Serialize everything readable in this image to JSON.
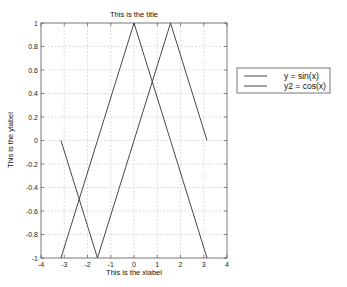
{
  "chart_data": {
    "type": "line",
    "title": "This is the title",
    "xlabel": "This is the xlabel",
    "ylabel": "This is the ylabel",
    "xlim": [
      -4,
      4
    ],
    "ylim": [
      -1,
      1
    ],
    "xticks": [
      -4,
      -3,
      -2,
      -1,
      0,
      1,
      2,
      3,
      4
    ],
    "yticks": [
      -1,
      -0.8,
      -0.6,
      -0.4,
      -0.2,
      0,
      0.2,
      0.4,
      0.6,
      0.8,
      1
    ],
    "xtick_labels": [
      "-4",
      "-3",
      "-2",
      "-1",
      "0",
      "1",
      "2",
      "3",
      "4"
    ],
    "ytick_labels": [
      "-1",
      "-0.8",
      "-0.6",
      "-0.4",
      "-0.2",
      "0",
      "0.2",
      "0.4",
      "0.6",
      "0.8",
      "1"
    ],
    "grid": true,
    "legend_position": "outside right, upper",
    "x": [
      -3.1416,
      -1.5708,
      0,
      1.5708,
      3.1416
    ],
    "series": [
      {
        "name": "y = sin(x)",
        "values": [
          0,
          -1,
          0,
          1,
          0
        ],
        "color": "#333333"
      },
      {
        "name": "y2 = cos(x)",
        "values": [
          -1,
          0,
          1,
          0,
          -1
        ],
        "color": "#333333"
      }
    ]
  },
  "legend": {
    "items": [
      "y = sin(x)",
      "y2 = cos(x)"
    ]
  },
  "colors": {
    "line": "#333333",
    "axis": "#555555",
    "grid": "#bbbbbb",
    "background": "#ffffff"
  }
}
